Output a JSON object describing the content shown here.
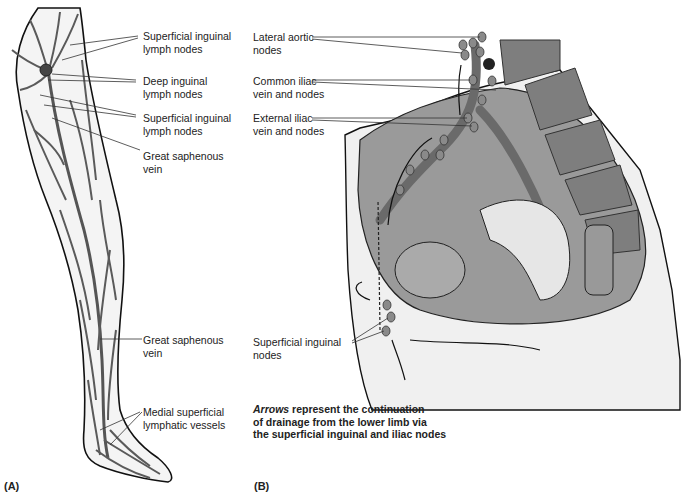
{
  "figure": {
    "panel_a": {
      "tag": "(A)",
      "labels": [
        {
          "line1": "Superficial inguinal",
          "line2": "lymph nodes"
        },
        {
          "line1": "Deep inguinal",
          "line2": "lymph nodes"
        },
        {
          "line1": "Superficial inguinal",
          "line2": "lymph nodes"
        },
        {
          "line1": "Great saphenous",
          "line2": "vein"
        },
        {
          "line1": "Great saphenous",
          "line2": "vein"
        },
        {
          "line1": "Medial superficial",
          "line2": "lymphatic vessels"
        }
      ]
    },
    "panel_b": {
      "tag": "(B)",
      "labels": [
        {
          "line1": "Lateral aortic",
          "line2": "nodes"
        },
        {
          "line1": "Common iliac",
          "line2": "vein and nodes"
        },
        {
          "line1": "External iliac",
          "line2": "vein and nodes"
        },
        {
          "line1": "Superficial inguinal",
          "line2": "nodes"
        }
      ],
      "caption": {
        "emphasis": "Arrows",
        "line1_rest": " represent the continuation",
        "line2": "of drainage from the lower limb via",
        "line3": "the superficial inguinal and iliac nodes"
      }
    },
    "colors": {
      "vessel": "#555555",
      "outline": "#111111",
      "skin": "#f2f2f2",
      "tissue": "#9a9a9a",
      "node": "#8a8a8a"
    }
  }
}
